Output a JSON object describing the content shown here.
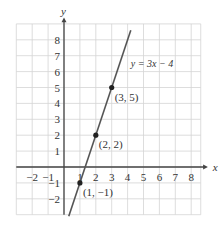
{
  "chart_data": {
    "type": "line",
    "title": "",
    "xlabel": "x",
    "ylabel": "y",
    "xlim": [
      -3,
      8.5
    ],
    "ylim": [
      -3,
      9
    ],
    "grid": true,
    "x_ticks": [
      -2,
      -1,
      1,
      2,
      3,
      4,
      5,
      6,
      7,
      8
    ],
    "y_ticks": [
      -2,
      -1,
      1,
      2,
      3,
      4,
      5,
      6,
      7,
      8
    ],
    "series": [
      {
        "name": "y = 3x − 4",
        "equation": "y = 3x − 4",
        "slope": 3,
        "intercept": -4,
        "color": "#555555"
      }
    ],
    "points": [
      {
        "x": 1,
        "y": -1,
        "label": "(1, −1)"
      },
      {
        "x": 2,
        "y": 2,
        "label": "(2, 2)"
      },
      {
        "x": 3,
        "y": 5,
        "label": "(3, 5)"
      }
    ],
    "annotations": [
      {
        "text": "y = 3x − 4",
        "x": 4.2,
        "y": 6.3
      }
    ]
  },
  "colors": {
    "grid": "#d4d4d4",
    "axis": "#444444",
    "line": "#555555",
    "point": "#222222",
    "text": "#333333"
  }
}
